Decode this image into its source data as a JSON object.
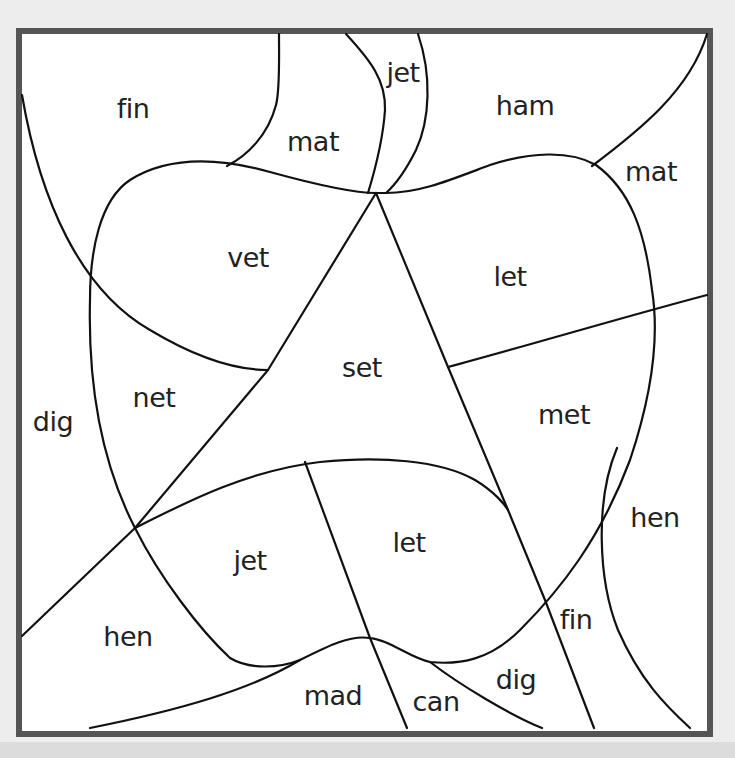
{
  "worksheet": {
    "type": "color-by-word puzzle",
    "frame_color": "#555555",
    "line_color": "#111111",
    "background": "#ffffff",
    "regions": [
      {
        "id": "fin-top-left",
        "word": "fin",
        "x": 133,
        "y": 108
      },
      {
        "id": "mat-top",
        "word": "mat",
        "x": 313,
        "y": 141
      },
      {
        "id": "jet-top",
        "word": "jet",
        "x": 403,
        "y": 72
      },
      {
        "id": "ham-top",
        "word": "ham",
        "x": 525,
        "y": 105
      },
      {
        "id": "mat-top-right",
        "word": "mat",
        "x": 651,
        "y": 171
      },
      {
        "id": "vet",
        "word": "vet",
        "x": 248,
        "y": 257
      },
      {
        "id": "let-upper",
        "word": "let",
        "x": 510,
        "y": 276
      },
      {
        "id": "set",
        "word": "set",
        "x": 362,
        "y": 367
      },
      {
        "id": "net",
        "word": "net",
        "x": 154,
        "y": 397
      },
      {
        "id": "dig-left",
        "word": "dig",
        "x": 53,
        "y": 421
      },
      {
        "id": "met",
        "word": "met",
        "x": 564,
        "y": 414
      },
      {
        "id": "hen-right",
        "word": "hen",
        "x": 655,
        "y": 517
      },
      {
        "id": "let-lower",
        "word": "let",
        "x": 409,
        "y": 542
      },
      {
        "id": "jet-lower",
        "word": "jet",
        "x": 250,
        "y": 560
      },
      {
        "id": "fin-lower",
        "word": "fin",
        "x": 576,
        "y": 619
      },
      {
        "id": "hen-left",
        "word": "hen",
        "x": 128,
        "y": 636
      },
      {
        "id": "dig-bottom",
        "word": "dig",
        "x": 516,
        "y": 679
      },
      {
        "id": "mad",
        "word": "mad",
        "x": 333,
        "y": 695
      },
      {
        "id": "can",
        "word": "can",
        "x": 436,
        "y": 701
      }
    ]
  }
}
